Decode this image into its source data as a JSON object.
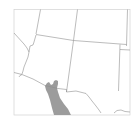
{
  "map": {
    "region": "Southwestern United States and northern Mexico",
    "colors": {
      "background": "#ffffff",
      "frame": "#d0d0d0",
      "borders": "#9a9a9a",
      "shaded_range": "#9e9e9e"
    },
    "shaded_area": "Sonora, Mexico"
  }
}
